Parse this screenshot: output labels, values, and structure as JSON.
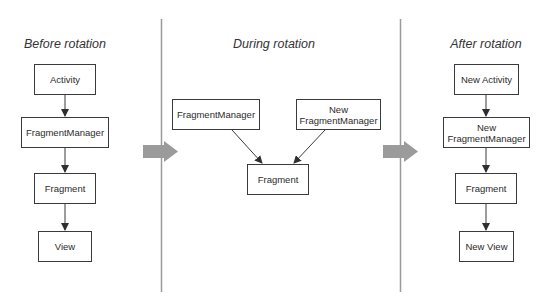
{
  "colors": {
    "box_border": "#3a3a3a",
    "connector": "#3a3a3a",
    "divider": "#9a9a9a",
    "transition_arrow": "#9b9b9b",
    "text": "#2b2b2b"
  },
  "sections": [
    {
      "id": "before",
      "heading": "Before rotation",
      "nodes": [
        {
          "id": "activity",
          "label": "Activity"
        },
        {
          "id": "fragment-manager",
          "label": "FragmentManager"
        },
        {
          "id": "fragment",
          "label": "Fragment"
        },
        {
          "id": "view",
          "label": "View"
        }
      ],
      "edges": [
        [
          "activity",
          "fragment-manager"
        ],
        [
          "fragment-manager",
          "fragment"
        ],
        [
          "fragment",
          "view"
        ]
      ]
    },
    {
      "id": "during",
      "heading": "During rotation",
      "nodes": [
        {
          "id": "fragment-manager",
          "label": "FragmentManager"
        },
        {
          "id": "new-fragment-manager",
          "label": "New\nFragmentManager"
        },
        {
          "id": "fragment",
          "label": "Fragment"
        }
      ],
      "edges": [
        [
          "fragment-manager",
          "fragment"
        ],
        [
          "new-fragment-manager",
          "fragment"
        ]
      ]
    },
    {
      "id": "after",
      "heading": "After rotation",
      "nodes": [
        {
          "id": "new-activity",
          "label": "New Activity"
        },
        {
          "id": "new-fragment-manager",
          "label": "New\nFragmentManager"
        },
        {
          "id": "fragment",
          "label": "Fragment"
        },
        {
          "id": "new-view",
          "label": "New View"
        }
      ],
      "edges": [
        [
          "new-activity",
          "new-fragment-manager"
        ],
        [
          "new-fragment-manager",
          "fragment"
        ],
        [
          "fragment",
          "new-view"
        ]
      ]
    }
  ],
  "transitions": [
    {
      "from": "before",
      "to": "during",
      "icon": "block-arrow-right"
    },
    {
      "from": "during",
      "to": "after",
      "icon": "block-arrow-right"
    }
  ]
}
